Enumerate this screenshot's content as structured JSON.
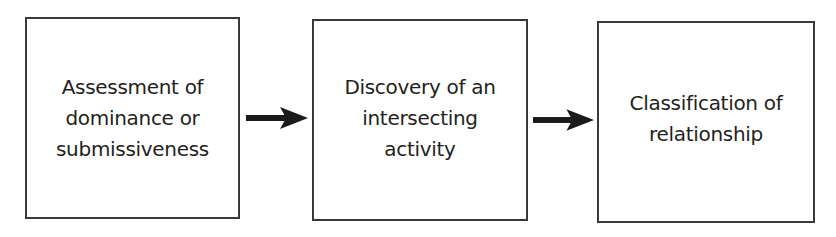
{
  "diagram": {
    "type": "flowchart",
    "direction": "left-to-right",
    "colors": {
      "border": "#3a3a3a",
      "text": "#231f20",
      "arrow": "#1a1a1a",
      "background": "#ffffff"
    },
    "nodes": [
      {
        "id": "box-1",
        "label": "Assessment of\ndominance or\nsubmissiveness"
      },
      {
        "id": "box-2",
        "label": "Discovery of an\nintersecting\nactivity"
      },
      {
        "id": "box-3",
        "label": "Classification of\nrelationship"
      }
    ],
    "edges": [
      {
        "from": "box-1",
        "to": "box-2",
        "icon": "arrow-right-icon"
      },
      {
        "from": "box-2",
        "to": "box-3",
        "icon": "arrow-right-icon"
      }
    ]
  }
}
